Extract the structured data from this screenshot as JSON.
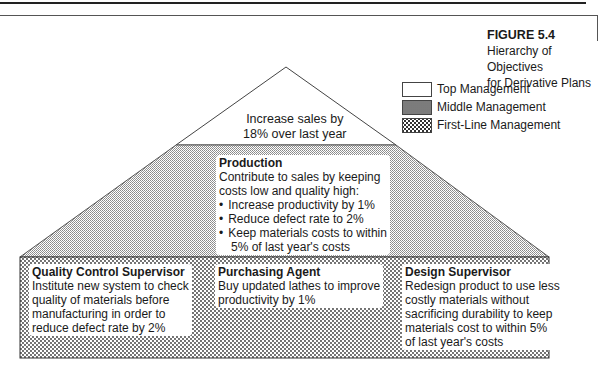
{
  "figure": {
    "number": "FIGURE 5.4",
    "title_line1": "Hierarchy of Objectives",
    "title_line2": "for Derivative Plans"
  },
  "legend": [
    {
      "label": "Top Management",
      "pattern": "blank"
    },
    {
      "label": "Middle Management",
      "pattern": "fine-dots"
    },
    {
      "label": "First-Line Management",
      "pattern": "coarse-dots"
    }
  ],
  "top": {
    "line1": "Increase sales by",
    "line2": "18% over last year"
  },
  "middle": {
    "heading": "Production",
    "line1": "Contribute to sales by keeping",
    "line2": "costs low and quality high:",
    "bullets": [
      "Increase productivity by 1%",
      "Reduce defect rate to 2%",
      "Keep materials costs to within"
    ],
    "bullet3_cont": "5% of last year's costs"
  },
  "bottom": [
    {
      "heading": "Quality Control Supervisor",
      "lines": [
        "Institute new system to check",
        "quality of materials before",
        "manufacturing in order to",
        "reduce defect rate by 2%"
      ]
    },
    {
      "heading": "Purchasing Agent",
      "lines": [
        "Buy updated lathes to improve",
        "productivity by 1%"
      ]
    },
    {
      "heading": "Design Supervisor",
      "lines": [
        "Redesign product to use less",
        "costly materials without",
        "sacrificing durability to keep",
        "materials cost to within 5%",
        "of last year's costs"
      ]
    }
  ]
}
